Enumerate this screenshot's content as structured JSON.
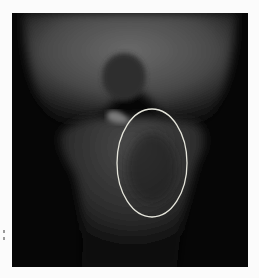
{
  "image": {
    "subject": "knee radiograph (AP view)",
    "annotation": {
      "shape": "ellipse",
      "color": "#e6e6dc",
      "center": [
        140,
        150
      ],
      "rx": 35,
      "ry": 54
    }
  }
}
